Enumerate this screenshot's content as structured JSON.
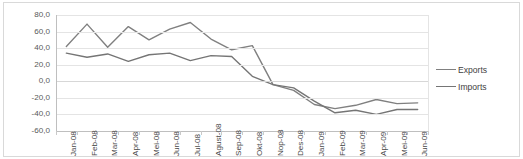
{
  "chart_data": {
    "type": "line",
    "title": "",
    "xlabel": "",
    "ylabel": "",
    "ylim": [
      -60.0,
      80.0
    ],
    "ytick_step": 20.0,
    "grid": true,
    "legend_position": "right",
    "ytick_labels": [
      "80,0",
      "60,0",
      "40,0",
      "20,0",
      "0,0",
      "-20,0",
      "-40,0",
      "-60,0"
    ],
    "ytick_values": [
      80.0,
      60.0,
      40.0,
      20.0,
      0.0,
      -20.0,
      -40.0,
      -60.0
    ],
    "categories": [
      "Jan-08",
      "Feb-08",
      "Mar-08",
      "Apr-08",
      "Mei-08",
      "Jun-08",
      "Jul-08",
      "Agust-08",
      "Sep-08",
      "Okt-08",
      "Nop-08",
      "Des-08",
      "Jan-09",
      "Feb-09",
      "Mar-09",
      "Apr-09",
      "Mei-09",
      "Jun-09"
    ],
    "series": [
      {
        "name": "Exports",
        "color": "#808080",
        "values": [
          42.0,
          69.0,
          41.0,
          66.0,
          50.0,
          63.0,
          71.0,
          51.0,
          38.0,
          43.0,
          -4.0,
          -11.0,
          -28.0,
          -33.0,
          -29.0,
          -22.0,
          -27.0,
          -26.0
        ]
      },
      {
        "name": "Imports",
        "color": "#757575",
        "values": [
          34.0,
          29.0,
          33.0,
          24.0,
          32.0,
          34.0,
          25.0,
          31.0,
          30.0,
          6.0,
          -4.0,
          -8.0,
          -24.0,
          -38.0,
          -35.0,
          -40.0,
          -34.0,
          -34.0
        ]
      }
    ]
  },
  "legend": {
    "items": [
      {
        "label": "Exports"
      },
      {
        "label": "Imports"
      }
    ]
  }
}
